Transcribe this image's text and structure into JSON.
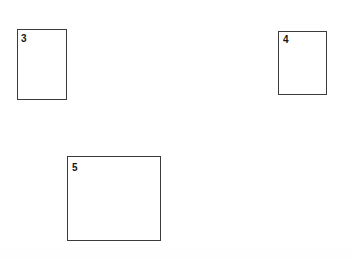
{
  "figure": {
    "background_color": "#ffffff",
    "width": 352,
    "height": 260,
    "stroke_color": "#3b3b3b",
    "label_color": "#161616",
    "shapes": [
      {
        "id": "rect-3",
        "label": "3",
        "shape": "rectangle",
        "x": 17,
        "y": 29,
        "width": 50,
        "height": 71,
        "label_x": 21,
        "label_y": 34,
        "fill": "#ffffff",
        "stroke": "#3b3b3b"
      },
      {
        "id": "rect-4",
        "label": "4",
        "shape": "rectangle",
        "x": 278,
        "y": 31,
        "width": 49,
        "height": 64,
        "label_x": 283,
        "label_y": 35,
        "fill": "#ffffff",
        "stroke": "#3b3b3b"
      },
      {
        "id": "rect-5",
        "label": "5",
        "shape": "rectangle",
        "x": 67,
        "y": 156,
        "width": 94,
        "height": 85,
        "label_x": 72,
        "label_y": 163,
        "fill": "#ffffff",
        "stroke": "#3b3b3b"
      }
    ]
  }
}
